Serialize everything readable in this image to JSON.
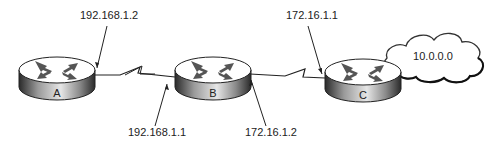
{
  "diagram": {
    "type": "network-topology",
    "routers": [
      {
        "id": "A",
        "label": "A"
      },
      {
        "id": "B",
        "label": "B"
      },
      {
        "id": "C",
        "label": "C"
      }
    ],
    "links": [
      {
        "from": "A",
        "to": "B",
        "kind": "serial",
        "endpoints": {
          "A": "192.168.1.2",
          "B": "192.168.1.1"
        }
      },
      {
        "from": "B",
        "to": "C",
        "kind": "serial",
        "endpoints": {
          "B": "172.16.1.2",
          "C": "172.16.1.1"
        }
      }
    ],
    "cloud": {
      "label": "10.0.0.0",
      "attached_to": "C"
    },
    "ip_labels": {
      "a_b_top": "192.168.1.2",
      "a_b_bottom": "192.168.1.1",
      "b_c_bottom": "172.16.1.2",
      "b_c_top": "172.16.1.1"
    }
  }
}
